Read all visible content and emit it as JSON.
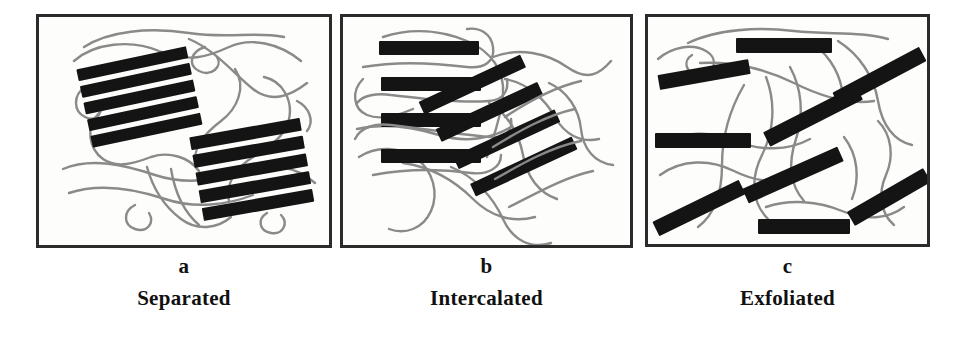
{
  "figure": {
    "background_color": "#ffffff",
    "panel_background": "#fdfdfb",
    "border_color": "#2b2b2b",
    "platelet_color": "#141414",
    "polymer_chain_color": "#8a8a8a"
  },
  "panels": [
    {
      "id": "a",
      "letter": "a",
      "name": "Separated",
      "frame": {
        "x": 36,
        "y": 14,
        "w": 296,
        "h": 234
      },
      "letter_pos": {
        "x": 36,
        "y": 256,
        "w": 296
      },
      "name_pos": {
        "x": 36,
        "y": 288,
        "w": 296
      },
      "description": "Two tightly-stacked clay tactoids (5 parallel platelets each) with no polymer between layers; polymer chains coil around the aggregates.",
      "stacks": [
        {
          "cx": 108,
          "cy": 88,
          "angle": -12,
          "platelet_count": 5,
          "platelet_w": 112,
          "platelet_h": 13,
          "gap": 5
        },
        {
          "cx": 243,
          "cy": 158,
          "angle": -10,
          "platelet_count": 5,
          "platelet_w": 112,
          "platelet_h": 14,
          "gap": 5
        }
      ],
      "platelet_total": 10,
      "chain_count": 9
    },
    {
      "id": "b",
      "letter": "b",
      "name": "Intercalated",
      "frame": {
        "x": 340,
        "y": 14,
        "w": 293,
        "h": 234
      },
      "letter_pos": {
        "x": 340,
        "y": 256,
        "w": 293
      },
      "name_pos": {
        "x": 340,
        "y": 288,
        "w": 293
      },
      "description": "Polymer chains are inserted between clay platelets, expanding the interlayer spacing while the layers stay parallel and ordered.",
      "groups": [
        {
          "name": "horizontal-group",
          "cx": 420,
          "cy": 88,
          "angle": 0,
          "platelet_count": 4,
          "platelet_w": 100,
          "platelet_h": 14,
          "gap": 22
        },
        {
          "name": "diagonal-group",
          "cx": 553,
          "cy": 150,
          "angle": -25,
          "platelet_count": 4,
          "platelet_w": 112,
          "platelet_h": 14,
          "gap": 25
        }
      ],
      "platelet_total": 8,
      "chain_count": 10
    },
    {
      "id": "c",
      "letter": "c",
      "name": "Exfoliated",
      "frame": {
        "x": 645,
        "y": 14,
        "w": 285,
        "h": 233
      },
      "letter_pos": {
        "x": 645,
        "y": 256,
        "w": 285
      },
      "name_pos": {
        "x": 645,
        "y": 288,
        "w": 285
      },
      "description": "Individual clay platelets are fully delaminated and randomly dispersed throughout the polymer matrix.",
      "platelets": [
        {
          "cx": 782,
          "cy": 42,
          "angle": 0,
          "w": 96,
          "h": 15
        },
        {
          "cx": 701,
          "cy": 71,
          "angle": -10,
          "w": 92,
          "h": 15
        },
        {
          "cx": 876,
          "cy": 73,
          "angle": -28,
          "w": 98,
          "h": 16
        },
        {
          "cx": 810,
          "cy": 113,
          "angle": -27,
          "w": 104,
          "h": 16
        },
        {
          "cx": 700,
          "cy": 137,
          "angle": 0,
          "w": 96,
          "h": 15
        },
        {
          "cx": 790,
          "cy": 172,
          "angle": -24,
          "w": 104,
          "h": 16
        },
        {
          "cx": 886,
          "cy": 194,
          "angle": -30,
          "w": 88,
          "h": 16
        },
        {
          "cx": 696,
          "cy": 205,
          "angle": -26,
          "w": 96,
          "h": 16
        },
        {
          "cx": 803,
          "cy": 230,
          "angle": 0,
          "w": 92,
          "h": 15
        }
      ],
      "platelet_total": 9,
      "chain_count": 11
    }
  ]
}
